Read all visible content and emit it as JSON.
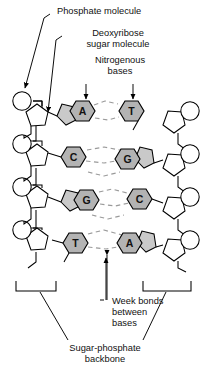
{
  "figure": {
    "background_color": "#ffffff",
    "line_color": "#000000",
    "base_fill_color": "#b3b3b3",
    "sugar_fill_color": "#c9c9c9",
    "hydrogen_bond_color": "#9a9a9a"
  },
  "labels": {
    "phosphate": "Phosphate molecule",
    "deoxyribose_line1": "Deoxyribose",
    "deoxyribose_line2": "sugar molecule",
    "nitrogenous_line1": "Nitrogenous",
    "nitrogenous_line2": "bases",
    "weak_bonds_line1": "Week bonds",
    "weak_bonds_line2": "between",
    "weak_bonds_line3": "bases",
    "backbone_line1": "Sugar-phosphate",
    "backbone_line2": "backbone"
  },
  "base_pairs": [
    {
      "left": "A",
      "right": "T",
      "left_type": "purine",
      "right_type": "pyrimidine",
      "bonds": 2
    },
    {
      "left": "C",
      "right": "G",
      "left_type": "pyrimidine",
      "right_type": "purine",
      "bonds": 3
    },
    {
      "left": "G",
      "right": "C",
      "left_type": "purine",
      "right_type": "pyrimidine",
      "bonds": 3
    },
    {
      "left": "T",
      "right": "A",
      "left_type": "pyrimidine",
      "right_type": "purine",
      "bonds": 2
    }
  ],
  "components": {
    "phosphate_shape": "circle",
    "sugar_shape": "pentagon",
    "purine_shape": "fused-pentagon-hexagon",
    "pyrimidine_shape": "hexagon",
    "hydrogen_bond_style": "dashed"
  }
}
